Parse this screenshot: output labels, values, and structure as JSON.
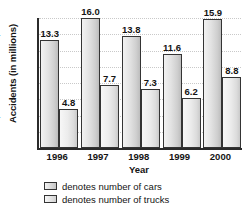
{
  "chart_data": {
    "type": "bar",
    "title": "",
    "xlabel": "Year",
    "ylabel": "Accidents (in millions)",
    "categories": [
      "1996",
      "1997",
      "1998",
      "1999",
      "2000"
    ],
    "series": [
      {
        "name": "denotes number of cars",
        "values": [
          13.3,
          16.0,
          13.8,
          11.6,
          15.9
        ],
        "labels": [
          "13.3",
          "16.0",
          "13.8",
          "11.6",
          "15.9"
        ],
        "color": "#cfcfcf"
      },
      {
        "name": "denotes number of trucks",
        "values": [
          4.8,
          7.7,
          7.3,
          6.2,
          8.8
        ],
        "labels": [
          "4.8",
          "7.7",
          "7.3",
          "6.2",
          "8.8"
        ],
        "color": "#dcdcdc"
      }
    ],
    "ylim": [
      0,
      16
    ],
    "yticks": [
      "0",
      "2",
      "4",
      "6",
      "8",
      "10",
      "12",
      "14",
      "16"
    ],
    "grid": true,
    "legend_position": "bottom-left"
  },
  "legend": {
    "items": [
      {
        "label": "denotes number of cars",
        "swatch": "cars-swatch"
      },
      {
        "label": "denotes number of trucks",
        "swatch": "trucks-swatch"
      }
    ]
  }
}
